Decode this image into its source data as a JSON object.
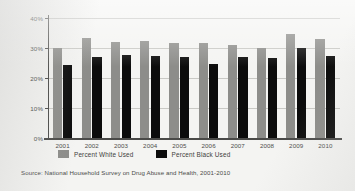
{
  "chart_data": {
    "type": "bar",
    "title": "",
    "xlabel": "",
    "ylabel": "",
    "ylim": [
      0,
      40
    ],
    "grid": true,
    "legend_position": "bottom-left",
    "categories": [
      "2001",
      "2002",
      "2003",
      "2004",
      "2005",
      "2006",
      "2007",
      "2008",
      "2009",
      "2010"
    ],
    "ytick_labels": [
      "0%",
      "10%",
      "20%",
      "30%",
      "40%"
    ],
    "ytick_values": [
      0,
      10,
      20,
      30,
      40
    ],
    "series": [
      {
        "name": "Percent White Used",
        "color": "#8d8d8a",
        "values": [
          30.0,
          33.5,
          32.0,
          32.2,
          31.6,
          31.7,
          31.0,
          30.1,
          34.8,
          33.0
        ]
      },
      {
        "name": "Percent Black Used",
        "color": "#0c0c0c",
        "values": [
          24.2,
          26.9,
          27.8,
          27.5,
          27.0,
          24.8,
          27.1,
          26.8,
          30.0,
          27.5
        ]
      }
    ],
    "source": "Source: National Household Survey on Drug Abuse and Health, 2001-2010"
  }
}
